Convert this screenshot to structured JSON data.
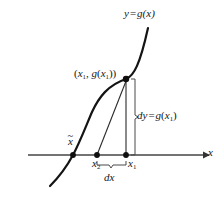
{
  "figure": {
    "background_color": "#ffffff",
    "ink_color": "#161616",
    "axis_color": "#3c3c3c",
    "labels": {
      "curve": "y = g(x)",
      "curve_y": "y",
      "curve_eq": "=",
      "curve_g": "g",
      "curve_arg": "(x)",
      "point": "(x1, g(x1))",
      "point_open": "(",
      "point_x": "x",
      "point_x_sub": "1",
      "point_comma": ", ",
      "point_g": "g",
      "point_g_open": "(",
      "point_g_x": "x",
      "point_g_sub": "1",
      "point_close": "))",
      "dy": "dy = g(x1)",
      "dy_d": "d",
      "dy_y": "y",
      "dy_eq": "=",
      "dy_g": "g",
      "dy_open": "(",
      "dy_x": "x",
      "dy_sub": "1",
      "dy_close": ")",
      "dx": "dx",
      "dx_d": "d",
      "dx_x": "x",
      "x1": "x1",
      "x1_base": "x",
      "x1_sub": "1",
      "x2": "x2",
      "x2_base": "x",
      "x2_sub": "2",
      "x_tilde": "x̃",
      "x_tilde_base": "x",
      "x_tilde_accent": "~",
      "axis_x": "x"
    },
    "axis": {
      "name": "x-axis",
      "y_pixel": 155,
      "x_start": 28,
      "x_end": 206,
      "arrow": "right"
    },
    "points": [
      {
        "name": "x-tilde-root",
        "label": "x̃",
        "x": 73,
        "y": 155,
        "marker": "filled-dot"
      },
      {
        "name": "x2-point",
        "label": "x2",
        "x": 97,
        "y": 155,
        "marker": "filled-dot"
      },
      {
        "name": "x1-point",
        "label": "x1",
        "x": 126,
        "y": 155,
        "marker": "filled-dot"
      },
      {
        "name": "curve-point",
        "label": "(x1, g(x1))",
        "x": 126,
        "y": 79,
        "marker": "filled-dot"
      }
    ],
    "braces": [
      {
        "name": "dy-brace",
        "orientation": "vertical",
        "from_y": 79,
        "to_y": 155,
        "x": 134
      },
      {
        "name": "dx-brace",
        "orientation": "horizontal",
        "from_x": 97,
        "to_x": 126,
        "y": 166
      }
    ],
    "elements": {
      "curve_name": "function-curve-g",
      "tangent_name": "tangent-line",
      "vertical_name": "vertical-drop-line"
    }
  }
}
